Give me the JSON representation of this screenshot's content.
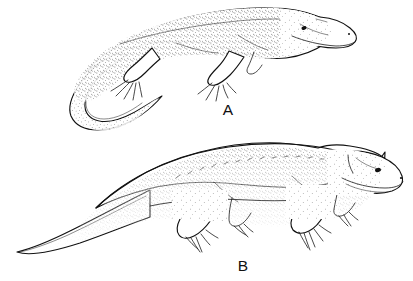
{
  "figure": {
    "background_color": "#ffffff",
    "ink_color": "#111111",
    "style": "stipple-and-line pen-and-ink scientific illustration",
    "width": 413,
    "height": 281
  },
  "specimens": [
    {
      "id": "A",
      "label": "A",
      "label_x": 228,
      "label_y": 115,
      "description": "Slender long-tailed quadrupedal reptile in three-quarter dorsolateral view, head to the right, tail curving down and to the left",
      "anatomy": {
        "head": "elongate low triangular skull with pointed snout, visible eye and nostril",
        "tail": "very long, tapering, curving downward then forward to a fine point",
        "limbs": "four sprawling limbs with five splayed digits each",
        "texture": "dense stipple shading along back and flanks"
      }
    },
    {
      "id": "B",
      "label": "B",
      "label_x": 243,
      "label_y": 271,
      "description": "Robust heavy-bodied quadrupedal reptile in lateral view, head to the right, thick tapering tail extending to the left",
      "anatomy": {
        "head": "large deep skull with rounded snout, visible eye, nostril and jaw line",
        "tail": "thick at the base, tapering evenly to a point at the left edge",
        "limbs": "four stout sprawling limbs with five clawed digits each",
        "texture": "heavy stipple over the dorsum with a row of dashes along the dorsal midline"
      }
    }
  ],
  "labels": {
    "a": "A",
    "b": "B"
  }
}
